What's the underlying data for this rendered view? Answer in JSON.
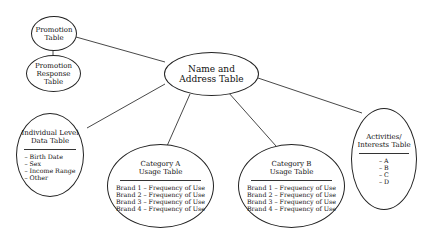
{
  "diagram": {
    "type": "entity relationship / table hierarchy",
    "nodes": {
      "promotion_table": {
        "title_lines": [
          "Promotion",
          "Table"
        ]
      },
      "promotion_response_table": {
        "title_lines": [
          "Promotion",
          "Response",
          "Table"
        ]
      },
      "name_address_table": {
        "title_lines": [
          "Name and",
          "Address Table"
        ]
      },
      "individual_level_table": {
        "title_lines": [
          "Individual Level",
          "Data Table"
        ],
        "items": [
          "– Birth Date",
          "– Sex",
          "– Income Range",
          "– Other"
        ]
      },
      "category_a_table": {
        "title_lines": [
          "Category A",
          "Usage Table"
        ],
        "items": [
          "Brand 1 – Frequency of Use",
          "Brand 2 – Frequency of Use",
          "Brand 3 – Frequency of Use",
          "Brand 4 – Frequency of Use"
        ]
      },
      "category_b_table": {
        "title_lines": [
          "Category B",
          "Usage Table"
        ],
        "items": [
          "Brand 1 – Frequency of Use",
          "Brand 2 – Frequency of Use",
          "Brand 3 – Frequency of Use",
          "Brand 4 – Frequency of Use"
        ]
      },
      "activities_interests_table": {
        "title_lines": [
          "Activities/",
          "Interests Table"
        ],
        "items": [
          "– A",
          "– B",
          "– C",
          "– D"
        ]
      }
    },
    "edges": [
      [
        "promotion_table",
        "promotion_response_table"
      ],
      [
        "promotion_table",
        "name_address_table"
      ],
      [
        "name_address_table",
        "individual_level_table"
      ],
      [
        "name_address_table",
        "category_a_table"
      ],
      [
        "name_address_table",
        "category_b_table"
      ],
      [
        "name_address_table",
        "activities_interests_table"
      ]
    ]
  }
}
